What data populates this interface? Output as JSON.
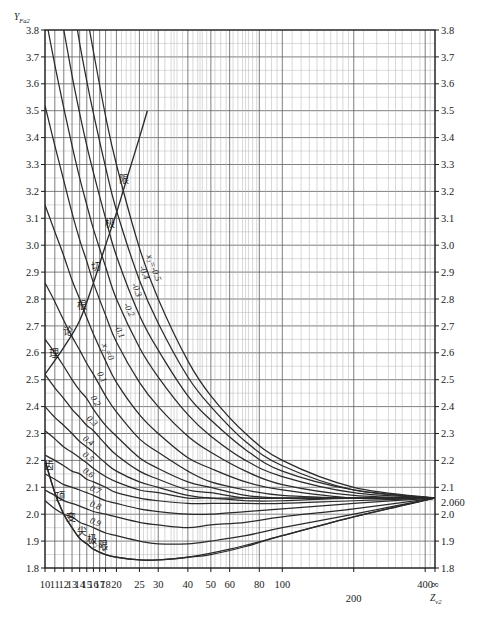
{
  "chart_data": {
    "type": "line",
    "title": "",
    "xlabel": "Z_v2",
    "ylabel": "Y_Fa2",
    "xscale": "log",
    "xlim": [
      10,
      440
    ],
    "ylim": [
      1.8,
      3.8
    ],
    "grid": true,
    "legend_position": "inline-curve-labels",
    "x_ticks": [
      {
        "value": 10,
        "label": "10"
      },
      {
        "value": 11,
        "label": "11"
      },
      {
        "value": 12,
        "label": "12"
      },
      {
        "value": 13,
        "label": "13"
      },
      {
        "value": 14,
        "label": "14"
      },
      {
        "value": 15,
        "label": "15"
      },
      {
        "value": 16,
        "label": "16"
      },
      {
        "value": 17,
        "label": "17"
      },
      {
        "value": 18,
        "label": "18"
      },
      {
        "value": 20,
        "label": "20"
      },
      {
        "value": 25,
        "label": "25"
      },
      {
        "value": 30,
        "label": "30"
      },
      {
        "value": 40,
        "label": "40"
      },
      {
        "value": 50,
        "label": "50"
      },
      {
        "value": 60,
        "label": "60"
      },
      {
        "value": 80,
        "label": "80"
      },
      {
        "value": 100,
        "label": "100"
      },
      {
        "value": 200,
        "label": "200"
      },
      {
        "value": 400,
        "label": "400"
      },
      {
        "value": 440,
        "label": "∞"
      }
    ],
    "x_minor_ticks": [
      10,
      11,
      12,
      13,
      14,
      15,
      16,
      17,
      18,
      19,
      20,
      22,
      24,
      25,
      26,
      28,
      30,
      32,
      34,
      36,
      38,
      40,
      45,
      50,
      55,
      60,
      65,
      70,
      75,
      80,
      90,
      100,
      120,
      140,
      160,
      180,
      200,
      250,
      300,
      350,
      400,
      440
    ],
    "y_ticks": [
      "3.8",
      "3.7",
      "3.6",
      "3.5",
      "3.4",
      "3.3",
      "3.2",
      "3.1",
      "3.0",
      "2.9",
      "2.8",
      "2.7",
      "2.6",
      "2.5",
      "2.4",
      "2.3",
      "2.2",
      "2.1",
      "2.0",
      "1.9",
      "1.8"
    ],
    "y_special_tick": {
      "value": 2.06,
      "label": "2.060"
    },
    "convergence_point": {
      "x": 440,
      "y": 2.06
    },
    "series": [
      {
        "name": "x₂=-0.5",
        "label": "x₂=-0.5",
        "x": [
          10,
          11,
          12,
          13,
          14,
          15,
          16,
          18,
          20,
          25,
          30,
          40,
          50,
          70,
          100,
          200,
          440
        ],
        "values": [
          5.05,
          4.72,
          4.45,
          4.22,
          4.03,
          3.86,
          3.72,
          3.48,
          3.3,
          2.99,
          2.8,
          2.57,
          2.44,
          2.3,
          2.2,
          2.1,
          2.06
        ]
      },
      {
        "name": "x₂=-0.4",
        "label": "-0.4",
        "x": [
          10,
          11,
          12,
          13,
          14,
          15,
          16,
          18,
          20,
          25,
          30,
          40,
          50,
          70,
          100,
          200,
          440
        ],
        "values": [
          4.62,
          4.34,
          4.11,
          3.92,
          3.75,
          3.61,
          3.49,
          3.29,
          3.13,
          2.87,
          2.71,
          2.51,
          2.4,
          2.27,
          2.18,
          2.09,
          2.06
        ]
      },
      {
        "name": "x₂=-0.3",
        "label": "-0.3",
        "x": [
          10,
          11,
          12,
          13,
          14,
          15,
          16,
          18,
          20,
          25,
          30,
          40,
          50,
          70,
          100,
          200,
          440
        ],
        "values": [
          4.22,
          3.99,
          3.8,
          3.63,
          3.49,
          3.37,
          3.27,
          3.1,
          2.96,
          2.74,
          2.61,
          2.44,
          2.35,
          2.24,
          2.16,
          2.09,
          2.06
        ]
      },
      {
        "name": "x₂=-0.2",
        "label": "-0.2",
        "x": [
          10,
          11,
          12,
          13,
          14,
          15,
          16,
          18,
          20,
          25,
          30,
          40,
          50,
          70,
          100,
          200,
          440
        ],
        "values": [
          3.86,
          3.67,
          3.51,
          3.37,
          3.25,
          3.15,
          3.06,
          2.92,
          2.8,
          2.62,
          2.51,
          2.37,
          2.29,
          2.2,
          2.14,
          2.08,
          2.06
        ]
      },
      {
        "name": "x₂=-0.1",
        "label": "-0.1",
        "x": [
          10,
          11,
          12,
          13,
          14,
          15,
          16,
          18,
          20,
          25,
          30,
          40,
          50,
          70,
          100,
          200,
          440
        ],
        "values": [
          3.52,
          3.37,
          3.24,
          3.12,
          3.02,
          2.94,
          2.86,
          2.74,
          2.64,
          2.49,
          2.4,
          2.29,
          2.23,
          2.16,
          2.11,
          2.07,
          2.06
        ]
      },
      {
        "name": "x₂=0",
        "label": "x₂=0",
        "x": [
          10,
          11,
          12,
          13,
          14,
          15,
          16,
          18,
          20,
          25,
          30,
          40,
          50,
          70,
          100,
          200,
          440
        ],
        "values": [
          3.15,
          3.05,
          2.96,
          2.87,
          2.8,
          2.73,
          2.67,
          2.57,
          2.49,
          2.37,
          2.3,
          2.21,
          2.17,
          2.12,
          2.09,
          2.06,
          2.06
        ]
      },
      {
        "name": "x₂=0.1",
        "label": "0.1",
        "x": [
          10,
          11,
          12,
          13,
          14,
          15,
          16,
          18,
          20,
          25,
          30,
          40,
          50,
          70,
          100,
          200,
          440
        ],
        "values": [
          2.86,
          2.79,
          2.72,
          2.66,
          2.61,
          2.56,
          2.52,
          2.44,
          2.38,
          2.28,
          2.23,
          2.16,
          2.12,
          2.09,
          2.07,
          2.06,
          2.06
        ]
      },
      {
        "name": "x₂=0.2",
        "label": "0.2",
        "x": [
          10,
          11,
          12,
          13,
          14,
          15,
          16,
          18,
          20,
          25,
          30,
          40,
          50,
          70,
          100,
          200,
          440
        ],
        "values": [
          2.65,
          2.6,
          2.55,
          2.5,
          2.46,
          2.43,
          2.39,
          2.33,
          2.29,
          2.21,
          2.17,
          2.12,
          2.1,
          2.07,
          2.06,
          2.06,
          2.06
        ]
      },
      {
        "name": "x₂=0.3",
        "label": "0.3",
        "x": [
          10,
          11,
          12,
          13,
          14,
          15,
          16,
          18,
          20,
          25,
          30,
          40,
          50,
          70,
          100,
          200,
          440
        ],
        "values": [
          2.52,
          2.47,
          2.43,
          2.39,
          2.36,
          2.33,
          2.31,
          2.26,
          2.22,
          2.16,
          2.13,
          2.09,
          2.08,
          2.06,
          2.06,
          2.06,
          2.06
        ]
      },
      {
        "name": "x₂=0.4",
        "label": "0.4",
        "x": [
          10,
          11,
          12,
          13,
          14,
          15,
          16,
          18,
          20,
          25,
          30,
          40,
          50,
          70,
          100,
          200,
          440
        ],
        "values": [
          2.4,
          2.36,
          2.33,
          2.3,
          2.27,
          2.25,
          2.23,
          2.19,
          2.16,
          2.12,
          2.1,
          2.07,
          2.06,
          2.06,
          2.06,
          2.06,
          2.06
        ]
      },
      {
        "name": "x₂=0.5",
        "label": "0.5",
        "x": [
          10,
          11,
          12,
          13,
          14,
          15,
          16,
          18,
          20,
          25,
          30,
          40,
          50,
          70,
          100,
          200,
          440
        ],
        "values": [
          2.31,
          2.28,
          2.25,
          2.23,
          2.21,
          2.19,
          2.17,
          2.14,
          2.12,
          2.09,
          2.08,
          2.06,
          2.06,
          2.05,
          2.05,
          2.06,
          2.06
        ]
      },
      {
        "name": "x₂=0.6",
        "label": "0.6",
        "x": [
          10,
          11,
          12,
          13,
          14,
          15,
          16,
          18,
          20,
          25,
          30,
          40,
          50,
          70,
          100,
          200,
          440
        ],
        "values": [
          2.22,
          2.2,
          2.18,
          2.16,
          2.15,
          2.13,
          2.12,
          2.1,
          2.08,
          2.06,
          2.05,
          2.04,
          2.04,
          2.04,
          2.04,
          2.05,
          2.06
        ]
      },
      {
        "name": "x₂=0.7",
        "label": "0.7",
        "x": [
          10,
          11,
          12,
          13,
          14,
          15,
          16,
          18,
          20,
          25,
          30,
          40,
          50,
          70,
          100,
          200,
          440
        ],
        "values": [
          2.15,
          2.13,
          2.11,
          2.1,
          2.09,
          2.08,
          2.07,
          2.05,
          2.04,
          2.02,
          2.01,
          2.0,
          2.0,
          2.01,
          2.02,
          2.04,
          2.06
        ]
      },
      {
        "name": "x₂=0.8",
        "label": "0.8",
        "x": [
          10,
          11,
          12,
          13,
          14,
          15,
          16,
          18,
          20,
          25,
          30,
          40,
          50,
          70,
          100,
          200,
          440
        ],
        "values": [
          2.09,
          2.07,
          2.05,
          2.04,
          2.03,
          2.02,
          2.01,
          2.0,
          1.99,
          1.97,
          1.96,
          1.95,
          1.96,
          1.97,
          1.99,
          2.02,
          2.06
        ]
      },
      {
        "name": "x₂=0.9",
        "label": "0.9",
        "x": [
          10,
          11,
          12,
          13,
          14,
          15,
          16,
          18,
          20,
          25,
          30,
          40,
          50,
          70,
          100,
          200,
          440
        ],
        "values": [
          2.05,
          2.02,
          2.0,
          1.99,
          1.97,
          1.96,
          1.95,
          1.93,
          1.92,
          1.9,
          1.89,
          1.89,
          1.9,
          1.92,
          1.95,
          2.0,
          2.06
        ]
      },
      {
        "name": "x₂=1",
        "label": "x₂=1",
        "x": [
          10,
          11,
          12,
          13,
          14,
          15,
          16,
          18,
          20,
          25,
          30,
          40,
          50,
          70,
          100,
          200,
          440
        ],
        "values": [
          2.2,
          2.08,
          2.0,
          1.95,
          1.91,
          1.89,
          1.87,
          1.85,
          1.84,
          1.83,
          1.83,
          1.84,
          1.85,
          1.88,
          1.92,
          1.99,
          2.06
        ]
      }
    ],
    "limit_curves": [
      {
        "name": "theoretical-undercut-limit",
        "label": "理论根切极限",
        "label_chars": [
          "理",
          "论",
          "根",
          "切",
          "极",
          "限"
        ],
        "x": [
          10,
          12,
          14,
          16,
          18,
          20,
          22,
          25,
          27
        ],
        "values": [
          2.52,
          2.62,
          2.72,
          2.86,
          3.0,
          3.12,
          3.24,
          3.4,
          3.5
        ]
      },
      {
        "name": "tooth-tip-sharpening-limit",
        "label": "齿顶变尖极限",
        "label_chars": [
          "齿",
          "顶",
          "变",
          "尖",
          "极",
          "限"
        ],
        "x": [
          10,
          11,
          12,
          13,
          14,
          15,
          16,
          18,
          20,
          25,
          30,
          40,
          60,
          100,
          200,
          440
        ],
        "values": [
          2.2,
          2.08,
          2.0,
          1.95,
          1.91,
          1.89,
          1.87,
          1.85,
          1.84,
          1.83,
          1.83,
          1.84,
          1.87,
          1.92,
          1.99,
          2.06
        ]
      }
    ],
    "annotations": [
      {
        "text": "理论根切极限",
        "meaning": "theoretical undercut limit"
      },
      {
        "text": "齿顶变尖极限",
        "meaning": "tooth tip sharpening limit"
      }
    ]
  },
  "axes": {
    "y_axis_name": "Y",
    "y_axis_sub": "Fa2",
    "x_axis_name": "Z",
    "x_axis_sub": "v2"
  },
  "caption": ""
}
